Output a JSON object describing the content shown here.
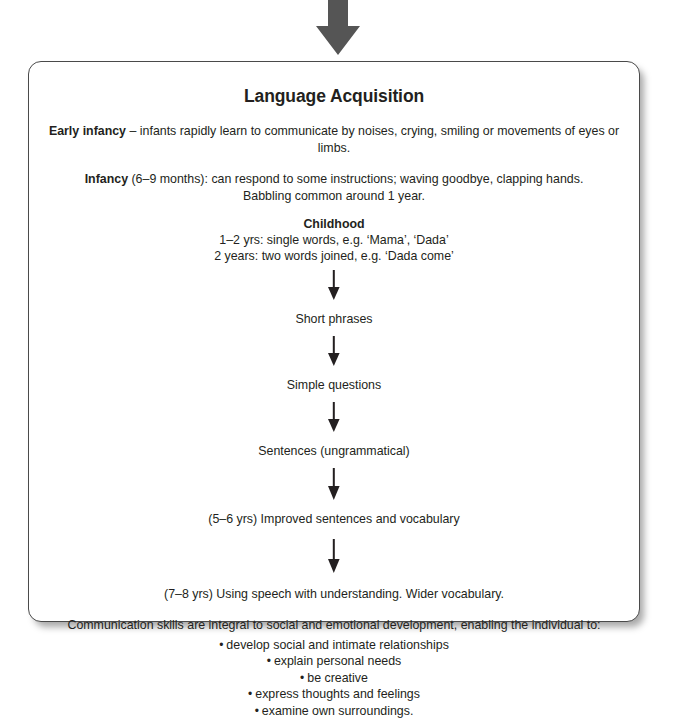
{
  "diagram": {
    "entry_arrow_icon": "down-arrow-icon",
    "title": "Language Acquisition",
    "intro": [
      {
        "id": "early-infancy",
        "lead": "Early infancy",
        "rest": " – infants rapidly learn to communicate by noises, crying, smiling or movements of eyes or limbs."
      },
      {
        "id": "infancy",
        "lead": "Infancy",
        "rest": " (6–9 months): can respond to some instructions; waving goodbye, clapping hands.",
        "extra": "Babbling common around 1 year."
      }
    ],
    "childhood": {
      "heading": "Childhood",
      "lines": [
        "1–2 yrs: single words, e.g. ‘Mama’, ‘Dada’",
        "2 years: two words joined, e.g. ‘Dada come’"
      ]
    },
    "flow_steps": [
      {
        "id": "short-phrases",
        "label": "Short phrases"
      },
      {
        "id": "simple-questions",
        "label": "Simple questions"
      },
      {
        "id": "sentences-ungrammatical",
        "label": "Sentences (ungrammatical)"
      },
      {
        "id": "improved-sentences",
        "label": "(5–6 yrs) Improved sentences and vocabulary"
      },
      {
        "id": "speech-understanding",
        "label": "(7–8 yrs) Using speech with understanding. Wider vocabulary."
      }
    ],
    "arrow_icon": "down-arrow-icon",
    "closing": {
      "intro": "Communication skills are integral to social and emotional development, enabling the individual to:",
      "bullet_glyph": "•",
      "items": [
        "develop social and intimate relationships",
        "explain personal needs",
        "be creative",
        "express thoughts and feelings",
        "examine own surroundings."
      ]
    },
    "colors": {
      "ink": "#231f20",
      "entry_arrow": "#555555",
      "panel_border": "#4a4a4a",
      "background": "#ffffff"
    }
  }
}
